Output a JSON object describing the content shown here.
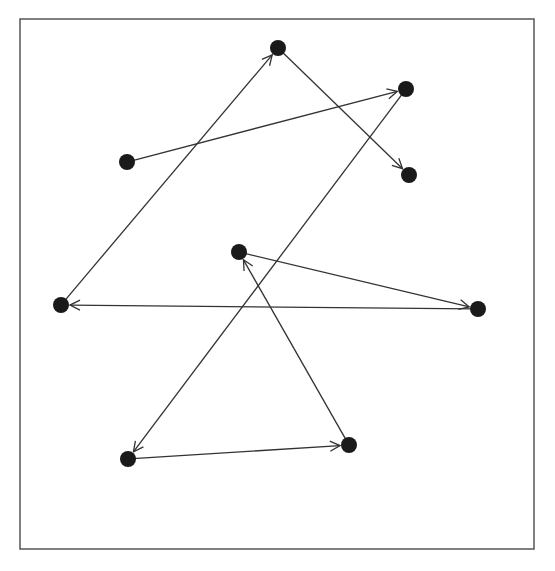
{
  "diagram": {
    "type": "directed-graph",
    "frame": {
      "x": 20,
      "y": 19,
      "width": 514,
      "height": 530,
      "stroke": "#555555"
    },
    "node_color": "#1a1a1a",
    "edge_color": "#333333",
    "node_radius": 8,
    "nodes": [
      {
        "id": "n1",
        "x": 278,
        "y": 48
      },
      {
        "id": "n2",
        "x": 406,
        "y": 89
      },
      {
        "id": "n3",
        "x": 127,
        "y": 162
      },
      {
        "id": "n4",
        "x": 409,
        "y": 175
      },
      {
        "id": "n5",
        "x": 239,
        "y": 252
      },
      {
        "id": "n6",
        "x": 61,
        "y": 305
      },
      {
        "id": "n7",
        "x": 478,
        "y": 309
      },
      {
        "id": "n8",
        "x": 349,
        "y": 445
      },
      {
        "id": "n9",
        "x": 128,
        "y": 459
      }
    ],
    "edges": [
      {
        "from": "n3",
        "to": "n2"
      },
      {
        "from": "n2",
        "to": "n9"
      },
      {
        "from": "n9",
        "to": "n8"
      },
      {
        "from": "n8",
        "to": "n5"
      },
      {
        "from": "n5",
        "to": "n7"
      },
      {
        "from": "n7",
        "to": "n6"
      },
      {
        "from": "n6",
        "to": "n1"
      },
      {
        "from": "n1",
        "to": "n4"
      }
    ]
  }
}
